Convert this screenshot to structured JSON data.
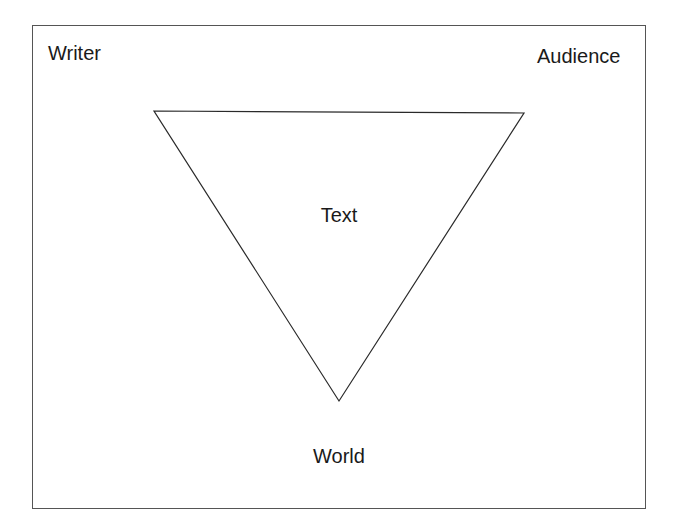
{
  "diagram": {
    "type": "inverted-triangle",
    "labels": {
      "top_left": "Writer",
      "top_right": "Audience",
      "center": "Text",
      "bottom": "World"
    },
    "triangle": {
      "vertices": [
        [
          154,
          111
        ],
        [
          524,
          113
        ],
        [
          339,
          401
        ]
      ],
      "stroke": "#2a2a2a"
    },
    "frame": {
      "stroke": "#555555"
    }
  }
}
